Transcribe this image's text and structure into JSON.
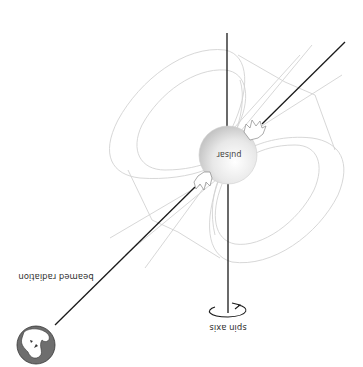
{
  "diagram": {
    "orientation": "rotated 180 degrees",
    "labels": {
      "pulsar": "pulsar",
      "spin_axis": "spin axis",
      "beamed_radiation": "beamed radiation"
    },
    "elements": [
      {
        "id": "pulsar",
        "type": "sphere",
        "label": "pulsar"
      },
      {
        "id": "spin-axis",
        "type": "line",
        "label": "spin axis",
        "has_rotation_arrow": true
      },
      {
        "id": "beam",
        "type": "line",
        "label": "beamed radiation"
      },
      {
        "id": "magnetic-field-lines",
        "type": "curves"
      },
      {
        "id": "earth",
        "type": "globe"
      }
    ],
    "colors": {
      "background": "#ffffff",
      "axis": "#1a1a1a",
      "field_lines": "#d2d2d2",
      "pulsar_fill": "#e6e6e6",
      "earth_ocean": "#6e6e6e",
      "earth_land": "#ffffff"
    }
  }
}
